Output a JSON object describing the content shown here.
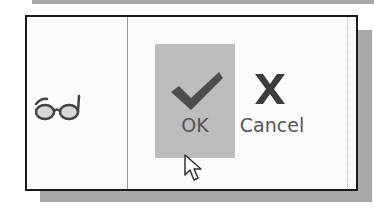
{
  "toolbar": {
    "view_icon": "glasses-icon",
    "ok": {
      "label": "OK",
      "icon": "checkmark-icon",
      "state": "hovered"
    },
    "cancel": {
      "label": "Cancel",
      "icon": "x-icon"
    }
  },
  "cursor": {
    "type": "arrow-pointer",
    "over": "OK"
  },
  "colors": {
    "highlight": "#bdbdbd",
    "icon": "#4a4a4a",
    "border": "#1a1a1a",
    "shadow": "#a9a9a9"
  }
}
